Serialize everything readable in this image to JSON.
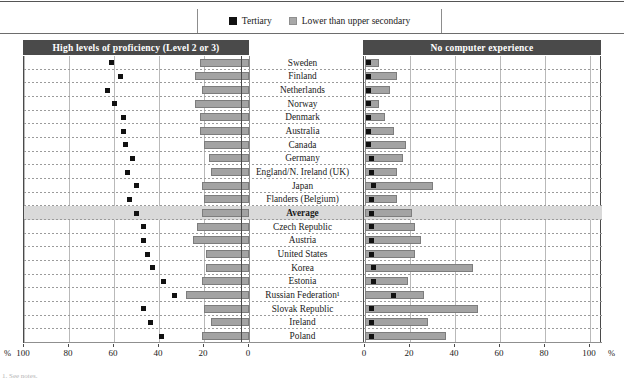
{
  "legend": {
    "items": [
      {
        "label": "Tertiary",
        "swatch": "black-square-icon",
        "color": "#111111"
      },
      {
        "label": "Lower than upper secondary",
        "swatch": "grey-square-icon",
        "color": "#a8a8a8"
      }
    ]
  },
  "panels": {
    "left": {
      "title": "High levels of proficiency (Level 2 or 3)"
    },
    "right": {
      "title": "No computer experience"
    }
  },
  "axis": {
    "left_ticks": [
      "100",
      "80",
      "60",
      "40",
      "20",
      "0"
    ],
    "right_ticks": [
      "0",
      "20",
      "40",
      "60",
      "80",
      "100"
    ],
    "unit_left": "%",
    "unit_right": "%"
  },
  "chart_data": {
    "type": "bar",
    "orientation": "horizontal-diverging",
    "xlabel": "%",
    "ylabel": "",
    "xlim_left": [
      0,
      100
    ],
    "xlim_right": [
      0,
      100
    ],
    "grid": true,
    "legend_position": "top-center",
    "categories": [
      "Sweden",
      "Finland",
      "Netherlands",
      "Norway",
      "Denmark",
      "Australia",
      "Canada",
      "Germany",
      "England/N. Ireland (UK)",
      "Japan",
      "Flanders (Belgium)",
      "Average",
      "Czech Republic",
      "Austria",
      "United States",
      "Korea",
      "Estonia",
      "Russian Federation¹",
      "Slovak Republic",
      "Ireland",
      "Poland"
    ],
    "series": [
      {
        "name": "Tertiary",
        "panel": "left",
        "marker": "square",
        "values": [
          61,
          57,
          63,
          60,
          56,
          56,
          55,
          52,
          54,
          50,
          53,
          50,
          47,
          47,
          45,
          43,
          38,
          33,
          47,
          44,
          39
        ]
      },
      {
        "name": "Lower than upper secondary",
        "panel": "left",
        "values": [
          22,
          24,
          21,
          24,
          22,
          22,
          20,
          18,
          17,
          21,
          20,
          21,
          23,
          25,
          19,
          19,
          21,
          28,
          20,
          17,
          21
        ]
      },
      {
        "name": "Tertiary",
        "panel": "right",
        "marker": "square",
        "values": [
          1,
          1,
          1,
          1,
          1,
          1,
          1,
          2,
          2,
          3,
          2,
          2,
          2,
          2,
          2,
          3,
          3,
          12,
          2,
          2,
          2
        ]
      },
      {
        "name": "Lower than upper secondary",
        "panel": "right",
        "values": [
          6,
          14,
          11,
          6,
          9,
          13,
          18,
          17,
          14,
          30,
          14,
          21,
          22,
          25,
          22,
          48,
          19,
          26,
          50,
          28,
          36
        ]
      }
    ]
  },
  "footnote": "1. See notes.",
  "clip_text": "",
  "clip_text2": ""
}
